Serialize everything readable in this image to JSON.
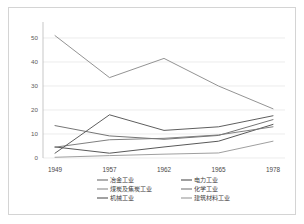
{
  "chart_data": {
    "type": "line",
    "title": "",
    "xlabel": "",
    "ylabel": "",
    "categories": [
      "1949",
      "1957",
      "1962",
      "1965",
      "1978"
    ],
    "ylim": [
      0,
      55
    ],
    "yticks": [
      0,
      10,
      20,
      30,
      40,
      50
    ],
    "ytick_labels": [
      "0",
      "10",
      "20",
      "30",
      "40",
      "50"
    ],
    "grid": true,
    "legend_position": "bottom",
    "series": [
      {
        "name": "冶金工业",
        "color": "#6e6e6e",
        "values": [
          13.5,
          9.2,
          7.8,
          9.4,
          16.0
        ]
      },
      {
        "name": "电力工业",
        "color": "#4f4f4f",
        "values": [
          4.6,
          2.0,
          4.6,
          7.0,
          14.0
        ]
      },
      {
        "name": "煤炭及焦炭工业",
        "color": "#8d8d8d",
        "values": [
          51.0,
          33.5,
          41.5,
          30.0,
          20.5
        ]
      },
      {
        "name": "化学工业",
        "color": "#787878",
        "values": [
          4.5,
          7.6,
          8.2,
          9.6,
          13.0
        ]
      },
      {
        "name": "机械工业",
        "color": "#555555",
        "values": [
          2.0,
          18.0,
          11.5,
          13.0,
          17.6
        ]
      },
      {
        "name": "建筑材料工业",
        "color": "#9a9a9a",
        "values": [
          0.3,
          1.0,
          1.6,
          2.1,
          7.0
        ]
      }
    ]
  },
  "legend": {
    "items": [
      {
        "label": "冶金工业"
      },
      {
        "label": "电力工业"
      },
      {
        "label": "煤炭及焦炭工业"
      },
      {
        "label": "化学工业"
      },
      {
        "label": "机械工业"
      },
      {
        "label": "建筑材料工业"
      }
    ]
  }
}
